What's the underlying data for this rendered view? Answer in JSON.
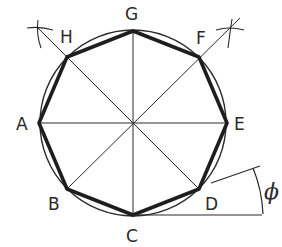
{
  "colors": {
    "ink": "#2a2a2a",
    "background": "#ffffff"
  },
  "geometry": {
    "center": [
      133,
      123
    ],
    "radius": 93
  },
  "vertices": [
    {
      "label": "A",
      "x": 39,
      "y": 123,
      "lx": 16,
      "ly": 130
    },
    {
      "label": "B",
      "x": 67,
      "y": 189,
      "lx": 48,
      "ly": 210
    },
    {
      "label": "C",
      "x": 133,
      "y": 215,
      "lx": 126,
      "ly": 242
    },
    {
      "label": "D",
      "x": 199,
      "y": 189,
      "lx": 205,
      "ly": 210
    },
    {
      "label": "E",
      "x": 227,
      "y": 123,
      "lx": 234,
      "ly": 130
    },
    {
      "label": "F",
      "x": 199,
      "y": 57,
      "lx": 196,
      "ly": 44
    },
    {
      "label": "G",
      "x": 133,
      "y": 31,
      "lx": 125,
      "ly": 20
    },
    {
      "label": "H",
      "x": 67,
      "y": 57,
      "lx": 60,
      "ly": 43
    }
  ],
  "angle": {
    "label": "ϕ",
    "lx": 266,
    "ly": 197
  }
}
